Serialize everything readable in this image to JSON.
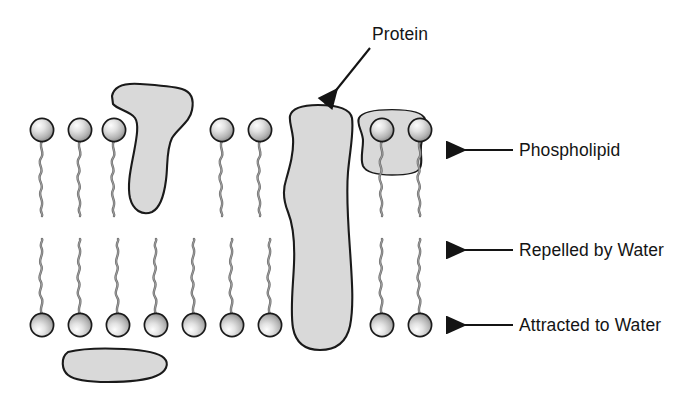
{
  "diagram": {
    "title_text": "",
    "type": "cell-membrane-phospholipid-bilayer",
    "background_color": "#ffffff",
    "structure_fill": "#d9d9d9",
    "structure_stroke": "#1a1a1a",
    "head_fill_light": "#f2f2f2",
    "head_fill_dark": "#9a9a9a",
    "tail_color": "#6b6b6b",
    "text_color": "#141414"
  },
  "labels": {
    "protein": "Protein",
    "phospholipid": "Phospholipid",
    "repelled_by_water": "Repelled by Water",
    "attracted_to_water": "Attracted to Water"
  },
  "callouts": [
    {
      "label": "Protein",
      "target": "transmembrane-protein",
      "arrow_direction": "down-left"
    },
    {
      "label": "Phospholipid",
      "target": "phospholipid-head-upper",
      "arrow_direction": "left"
    },
    {
      "label": "Repelled by Water",
      "target": "fatty-acid-tails-interior",
      "arrow_direction": "left"
    },
    {
      "label": "Attracted to Water",
      "target": "phospholipid-head-lower",
      "arrow_direction": "left"
    }
  ],
  "membrane": {
    "upper_leaflet": {
      "name": "upper-leaflet",
      "head_count": 7,
      "head_x": [
        42,
        80,
        114,
        222,
        260,
        382,
        420
      ],
      "head_y": 130,
      "head_radius": 12,
      "tail_length": 72,
      "orientation": "head-up"
    },
    "lower_leaflet": {
      "name": "lower-leaflet",
      "head_count": 9,
      "head_x": [
        42,
        80,
        118,
        156,
        194,
        232,
        270,
        382,
        420
      ],
      "head_y": 325,
      "head_radius": 12,
      "tail_length": 72,
      "orientation": "head-down"
    }
  },
  "proteins": [
    {
      "name": "peripheral-protein-upper-left",
      "position": "upper-leaflet-embedded",
      "shape": "irregular-blob"
    },
    {
      "name": "transmembrane-protein",
      "position": "spans-bilayer",
      "shape": "tall-irregular-blob"
    },
    {
      "name": "peripheral-protein-upper-right",
      "position": "upper-leaflet-outer",
      "shape": "rounded-blob"
    },
    {
      "name": "peripheral-protein-lower-left",
      "position": "below-lower-leaflet",
      "shape": "elongated-blob"
    }
  ]
}
